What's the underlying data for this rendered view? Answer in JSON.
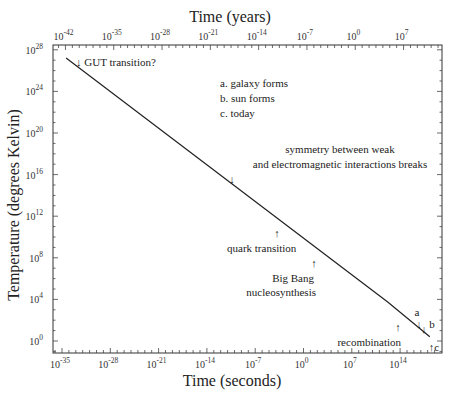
{
  "chart_data": {
    "type": "line",
    "title": "",
    "xlabel": "Time (seconds)",
    "ylabel": "Temperature (degrees Kelvin)",
    "x2label": "Time (years)",
    "xscale": "log",
    "yscale": "log",
    "xlim_exp": [
      -36.3,
      19.5
    ],
    "ylim_exp": [
      -1.1,
      28.4
    ],
    "x_ticks_bottom": [
      {
        "base": "10",
        "exp": "-35",
        "value_exp": -35
      },
      {
        "base": "10",
        "exp": "-28",
        "value_exp": -28
      },
      {
        "base": "10",
        "exp": "-21",
        "value_exp": -21
      },
      {
        "base": "10",
        "exp": "-14",
        "value_exp": -14
      },
      {
        "base": "10",
        "exp": "-7",
        "value_exp": -7
      },
      {
        "base": "10",
        "exp": "0",
        "value_exp": 0
      },
      {
        "base": "10",
        "exp": "7",
        "value_exp": 7
      },
      {
        "base": "10",
        "exp": "14",
        "value_exp": 14
      }
    ],
    "x_ticks_top": [
      {
        "base": "10",
        "exp": "-42",
        "value_exp": -42
      },
      {
        "base": "10",
        "exp": "-35",
        "value_exp": -35
      },
      {
        "base": "10",
        "exp": "-28",
        "value_exp": -28
      },
      {
        "base": "10",
        "exp": "-21",
        "value_exp": -21
      },
      {
        "base": "10",
        "exp": "-14",
        "value_exp": -14
      },
      {
        "base": "10",
        "exp": "-7",
        "value_exp": -7
      },
      {
        "base": "10",
        "exp": "0",
        "value_exp": 0
      },
      {
        "base": "10",
        "exp": "7",
        "value_exp": 7
      }
    ],
    "y_ticks": [
      {
        "base": "10",
        "exp": "28",
        "value_exp": 28
      },
      {
        "base": "10",
        "exp": "24",
        "value_exp": 24
      },
      {
        "base": "10",
        "exp": "20",
        "value_exp": 20
      },
      {
        "base": "10",
        "exp": "16",
        "value_exp": 16
      },
      {
        "base": "10",
        "exp": "12",
        "value_exp": 12
      },
      {
        "base": "10",
        "exp": "8",
        "value_exp": 8
      },
      {
        "base": "10",
        "exp": "4",
        "value_exp": 4
      },
      {
        "base": "10",
        "exp": "0",
        "value_exp": 0
      }
    ],
    "series": [
      {
        "name": "Temperature of the universe",
        "points_log10": [
          {
            "t_s": -34.4,
            "T_K": 27.2
          },
          {
            "t_s": 12.2,
            "T_K": 3.75
          },
          {
            "t_s": 18.3,
            "T_K": 0.4
          }
        ]
      }
    ],
    "annotations": [
      {
        "id": "gut",
        "text": "↓ GUT transition?"
      },
      {
        "id": "legend-a",
        "text": "a. galaxy forms"
      },
      {
        "id": "legend-b",
        "text": "b. sun forms"
      },
      {
        "id": "legend-c",
        "text": "c. today"
      },
      {
        "id": "electroweak-1",
        "text": "symmetry between weak"
      },
      {
        "id": "electroweak-2",
        "text": "and electromagnetic interactions breaks"
      },
      {
        "id": "electroweak-arrow",
        "text": "↓"
      },
      {
        "id": "quark-arrow",
        "text": "↑"
      },
      {
        "id": "quark",
        "text": "quark transition"
      },
      {
        "id": "bbn-arrow",
        "text": "↑"
      },
      {
        "id": "bbn-1",
        "text": "Big Bang"
      },
      {
        "id": "bbn-2",
        "text": "nucleosynthesis"
      },
      {
        "id": "recomb-arrow",
        "text": "↑"
      },
      {
        "id": "recomb",
        "text": "recombination"
      },
      {
        "id": "mark-a",
        "text": "a"
      },
      {
        "id": "mark-a-arrow",
        "text": "↓"
      },
      {
        "id": "mark-b-arrow",
        "text": "↓"
      },
      {
        "id": "mark-b",
        "text": "b"
      },
      {
        "id": "mark-c",
        "text": "↑c"
      }
    ]
  }
}
